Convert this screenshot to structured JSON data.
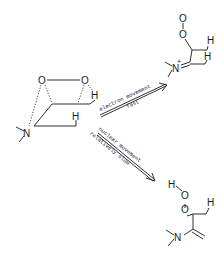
{
  "figure": {
    "type": "reaction-scheme",
    "reactant": {
      "name": "transition-state",
      "atoms": {
        "o_left": "O",
        "o_right": "O",
        "h_top": "H",
        "h_mid": "H",
        "n": "N"
      }
    },
    "pathways": [
      {
        "name": "upper",
        "label_top": "electron movement",
        "label_bottom": "fast"
      },
      {
        "name": "lower",
        "label_top": "nuclear movement",
        "label_bottom": "relatively slow"
      }
    ],
    "product_upper": {
      "atoms": {
        "o1": "O",
        "o2": "O",
        "h1": "H",
        "h2": "H",
        "n": "N",
        "charge": "+"
      }
    },
    "product_lower": {
      "atoms": {
        "h_oh": "H",
        "o1": "O",
        "o2": "O",
        "h1": "H",
        "n": "N"
      }
    }
  }
}
